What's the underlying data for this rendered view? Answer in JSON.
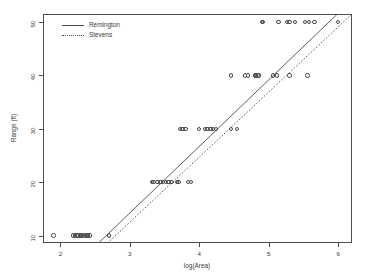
{
  "chart_data": {
    "type": "scatter",
    "title": "",
    "xlabel": "log(Area)",
    "ylabel": "Range (ft)",
    "xlim": [
      1.75,
      6.2
    ],
    "ylim": [
      8.6,
      51.5
    ],
    "xticks": [
      2,
      3,
      4,
      5,
      6
    ],
    "yticks": [
      10,
      20,
      30,
      40,
      50
    ],
    "xtick_labels": [
      "2",
      "3",
      "4",
      "5",
      "6"
    ],
    "ytick_labels": [
      "10",
      "20",
      "30",
      "40",
      "50"
    ],
    "grid": false,
    "legend_position": "top-left",
    "point_marker": "open-circle",
    "point_color": "#4a4a4a",
    "line_color": "#4a4a4a",
    "series": [
      {
        "name": "Observations",
        "marker": "open-circle",
        "points": [
          [
            1.9,
            10
          ],
          [
            2.18,
            10
          ],
          [
            2.21,
            10
          ],
          [
            2.24,
            10
          ],
          [
            2.26,
            10
          ],
          [
            2.28,
            10
          ],
          [
            2.3,
            10
          ],
          [
            2.33,
            10
          ],
          [
            2.36,
            10
          ],
          [
            2.38,
            10
          ],
          [
            2.4,
            10
          ],
          [
            2.43,
            10
          ],
          [
            2.7,
            10
          ],
          [
            3.32,
            20
          ],
          [
            3.34,
            20
          ],
          [
            3.4,
            20
          ],
          [
            3.44,
            20
          ],
          [
            3.48,
            20
          ],
          [
            3.52,
            20
          ],
          [
            3.56,
            20
          ],
          [
            3.6,
            20
          ],
          [
            3.68,
            20
          ],
          [
            3.7,
            20
          ],
          [
            3.84,
            20
          ],
          [
            3.88,
            20
          ],
          [
            3.72,
            30
          ],
          [
            3.76,
            30
          ],
          [
            3.8,
            30
          ],
          [
            4.0,
            30
          ],
          [
            4.08,
            30
          ],
          [
            4.12,
            30
          ],
          [
            4.16,
            30
          ],
          [
            4.2,
            30
          ],
          [
            4.24,
            30
          ],
          [
            4.46,
            30
          ],
          [
            4.54,
            30
          ],
          [
            4.46,
            40
          ],
          [
            4.66,
            40
          ],
          [
            4.7,
            40
          ],
          [
            4.8,
            40
          ],
          [
            4.82,
            40
          ],
          [
            4.84,
            40
          ],
          [
            4.86,
            40
          ],
          [
            5.06,
            40
          ],
          [
            5.12,
            40
          ],
          [
            5.3,
            40
          ],
          [
            5.56,
            40
          ],
          [
            4.9,
            50
          ],
          [
            4.92,
            50
          ],
          [
            5.14,
            50
          ],
          [
            5.26,
            50
          ],
          [
            5.3,
            50
          ],
          [
            5.38,
            50
          ],
          [
            5.52,
            50
          ],
          [
            5.58,
            50
          ],
          [
            5.66,
            50
          ],
          [
            6.0,
            50
          ]
        ]
      }
    ],
    "fits": [
      {
        "name": "Remington",
        "style": "solid",
        "x_start": 2.55,
        "y_start": 8.6,
        "x_end": 5.99,
        "y_end": 51.5
      },
      {
        "name": "Stevens",
        "style": "dotted",
        "x_start": 2.68,
        "y_start": 8.6,
        "x_end": 6.2,
        "y_end": 51.5
      }
    ],
    "legend": [
      {
        "label": "Remington",
        "style": "solid"
      },
      {
        "label": "Stevens",
        "style": "dotted"
      }
    ]
  }
}
